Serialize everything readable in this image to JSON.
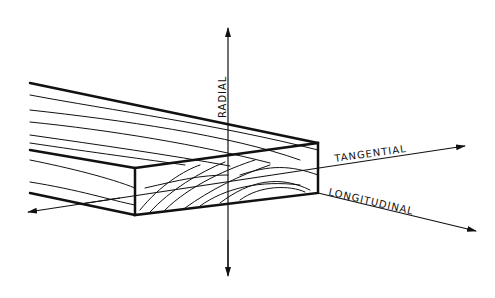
{
  "diagram": {
    "axes": [
      {
        "id": "radial",
        "label": "RADIAL"
      },
      {
        "id": "tangential",
        "label": "TANGENTIAL"
      },
      {
        "id": "longitudinal",
        "label": "LONGITUDINAL"
      }
    ],
    "colors": {
      "ink": "#111111",
      "background": "#ffffff"
    }
  }
}
